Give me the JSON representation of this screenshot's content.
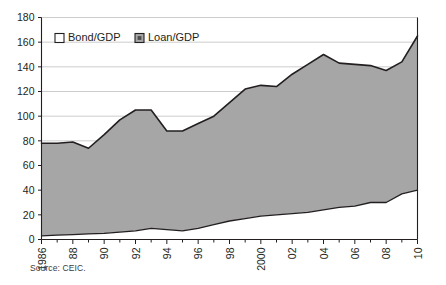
{
  "source_note": "Source: CEIC.",
  "legend": {
    "position": "top-left-inside",
    "entries": [
      {
        "label": "Bond/GDP",
        "marker_fill": "#ffffff",
        "marker_stroke": "#231f20"
      },
      {
        "label": "Loan/GDP",
        "marker_fill": "#a6a6a6",
        "marker_stroke": "#231f20"
      }
    ]
  },
  "colors": {
    "bond_fill": "#ffffff",
    "loan_fill": "#a6a6a6",
    "line": "#231f20",
    "grid": "#bfbfbf",
    "axis": "#231f20",
    "text": "#231f20"
  },
  "chart_data": {
    "type": "area",
    "stacked": true,
    "title": "",
    "subtitle": "",
    "xlabel": "",
    "ylabel": "",
    "grid": true,
    "legend_position": "top-left-inside",
    "ylim": [
      0,
      180
    ],
    "yticks": [
      0,
      20,
      40,
      60,
      80,
      100,
      120,
      140,
      160,
      180
    ],
    "ytick_labels": [
      "0",
      "20",
      "40",
      "60",
      "80",
      "100",
      "120",
      "140",
      "160",
      "180"
    ],
    "xlim": [
      1986,
      2010
    ],
    "x": [
      1986,
      1987,
      1988,
      1989,
      1990,
      1991,
      1992,
      1993,
      1994,
      1995,
      1996,
      1997,
      1998,
      1999,
      2000,
      2001,
      2002,
      2003,
      2004,
      2005,
      2006,
      2007,
      2008,
      2009,
      2010
    ],
    "xticks": [
      1986,
      1988,
      1990,
      1992,
      1994,
      1996,
      1998,
      2000,
      2002,
      2004,
      2006,
      2008,
      2010
    ],
    "xtick_labels": [
      "1986",
      "88",
      "90",
      "92",
      "94",
      "96",
      "98",
      "2000",
      "02",
      "04",
      "06",
      "08",
      "10"
    ],
    "series": [
      {
        "name": "Bond/GDP",
        "values": [
          3,
          3.5,
          4,
          4.5,
          5,
          6,
          7,
          9,
          8,
          7,
          9,
          12,
          15,
          17,
          19,
          20,
          21,
          22,
          24,
          26,
          27,
          30,
          30,
          37,
          40
        ]
      },
      {
        "name": "Loan/GDP",
        "values": [
          75,
          74.5,
          75,
          69.5,
          80,
          91,
          98,
          96,
          80,
          81,
          85,
          88,
          96,
          105,
          106,
          104,
          113,
          120,
          126,
          117,
          115,
          111,
          107,
          107,
          125
        ]
      }
    ],
    "totals": [
      78,
      78,
      79,
      74,
      85,
      97,
      105,
      105,
      88,
      88,
      94,
      100,
      111,
      122,
      125,
      124,
      134,
      142,
      150,
      143,
      142,
      141,
      137,
      144,
      165
    ]
  }
}
